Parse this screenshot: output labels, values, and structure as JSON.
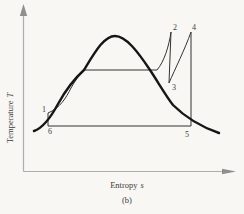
{
  "figure": {
    "kind": "temperature-entropy diagram sketch",
    "caption": "(b)",
    "y_axis": {
      "label": "Temperature",
      "symbol": "T"
    },
    "x_axis": {
      "label": "Entropy",
      "symbol": "s"
    },
    "state_points": {
      "p1": "1",
      "p2": "2",
      "p3": "3",
      "p4": "4",
      "p5": "5",
      "p6": "6"
    },
    "colors": {
      "background": "#f8f7f4",
      "dome_curve": "#161616",
      "cycle_lines": "#333333",
      "axis_lines": "#aeaeae",
      "axis_arrows": "#8f8f8f",
      "text": "#3c3c3c"
    },
    "paths": {
      "y_axis_line": "M 23.5 171.5 L 23.5 15",
      "y_axis_arrow": "M 23.5 4 L 27.2 16 L 19.8 16 Z",
      "x_axis_line": "M 23.5 171.5 L 223 171.5",
      "x_axis_arrow": "M 236 171.5 L 222 168.7 L 222 174.3 Z",
      "saturation_dome": "M 34 131 C 43 128 51 117 58 104 C 64 93 73 80 84 70 C 95 52 104 36 115 36 C 126 36 138 52 150 70 C 158 82 166 96 173 105 C 181 113 196 125 219 133",
      "cycle_path": "M 48 126 L 48 113 C 60 108 66 98 71 88 C 75 81 79 75 84 70 L 157 70 C 164 62 169 46 171 32 L 169 83 C 175 69 185 49 191 32 L 191 126 L 48 126 Z"
    }
  }
}
